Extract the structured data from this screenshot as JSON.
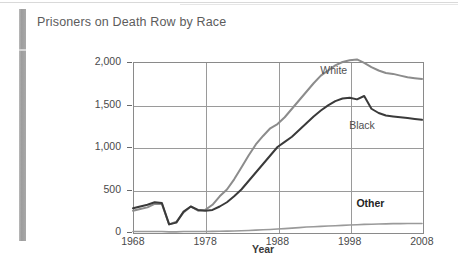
{
  "page": {
    "title": "Prisoners on Death Row by Race"
  },
  "chart_data": {
    "type": "line",
    "title": "Prisoners on Death Row by Race",
    "xlabel": "Year",
    "ylabel": "",
    "xlim": [
      1968,
      2008
    ],
    "ylim": [
      0,
      2000
    ],
    "grid": true,
    "legend_position": "inline-labels",
    "xticks": [
      "1968",
      "1978",
      "1988",
      "1998",
      "2008"
    ],
    "yticks": [
      "0",
      "500",
      "1,000",
      "1,500",
      "2,000"
    ],
    "x": [
      1968,
      1969,
      1970,
      1971,
      1972,
      1973,
      1974,
      1975,
      1976,
      1977,
      1978,
      1979,
      1980,
      1981,
      1982,
      1983,
      1984,
      1985,
      1986,
      1987,
      1988,
      1989,
      1990,
      1991,
      1992,
      1993,
      1994,
      1995,
      1996,
      1997,
      1998,
      1999,
      2000,
      2001,
      2002,
      2003,
      2004,
      2005,
      2006,
      2007,
      2008
    ],
    "series": [
      {
        "name": "White",
        "color": "#8c8c8c",
        "label_x": 1996,
        "label_y": 1900,
        "values": [
          250,
          270,
          290,
          330,
          330,
          90,
          120,
          230,
          300,
          250,
          260,
          320,
          420,
          500,
          620,
          760,
          900,
          1030,
          1130,
          1220,
          1270,
          1350,
          1450,
          1550,
          1650,
          1750,
          1840,
          1900,
          1960,
          2000,
          2020,
          2030,
          1990,
          1940,
          1900,
          1870,
          1860,
          1840,
          1820,
          1810,
          1800
        ]
      },
      {
        "name": "Black",
        "color": "#3a3a3a",
        "label_x": 2000,
        "label_y": 1250,
        "values": [
          280,
          300,
          320,
          350,
          340,
          90,
          110,
          240,
          300,
          260,
          250,
          260,
          300,
          350,
          420,
          500,
          600,
          700,
          800,
          900,
          1000,
          1060,
          1120,
          1200,
          1280,
          1360,
          1430,
          1490,
          1540,
          1570,
          1580,
          1560,
          1600,
          1450,
          1400,
          1370,
          1360,
          1350,
          1340,
          1330,
          1320
        ]
      },
      {
        "name": "Other",
        "color": "#9a9a9a",
        "label_x": 2001,
        "label_y": 330,
        "values": [
          5,
          5,
          5,
          5,
          5,
          2,
          2,
          5,
          6,
          6,
          6,
          7,
          8,
          10,
          12,
          15,
          18,
          22,
          26,
          30,
          35,
          40,
          46,
          52,
          58,
          62,
          66,
          70,
          74,
          78,
          82,
          86,
          90,
          92,
          94,
          96,
          98,
          99,
          100,
          100,
          100
        ]
      }
    ]
  }
}
